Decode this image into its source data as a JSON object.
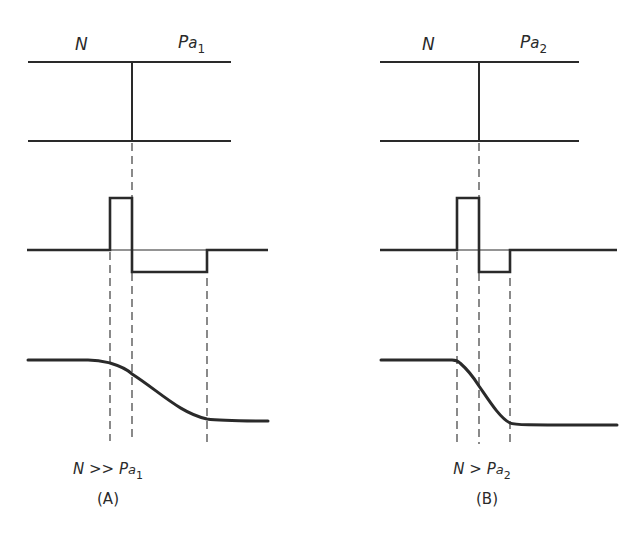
{
  "panels": [
    {
      "id": "A",
      "region_left_label": "N",
      "region_right_label_base": "P",
      "region_right_label_italic": "a",
      "region_right_label_subscript": "1",
      "condition_prefix": "N >> P",
      "condition_italic": "a",
      "condition_subscript": "1",
      "caption": "(A)"
    },
    {
      "id": "B",
      "region_left_label": "N",
      "region_right_label_base": "P",
      "region_right_label_italic": "a",
      "region_right_label_subscript": "2",
      "condition_prefix": "N > P",
      "condition_italic": "a",
      "condition_subscript": "2",
      "caption": "(B)"
    }
  ],
  "colors": {
    "ink": "#2a2a2a",
    "background": "#ffffff"
  }
}
